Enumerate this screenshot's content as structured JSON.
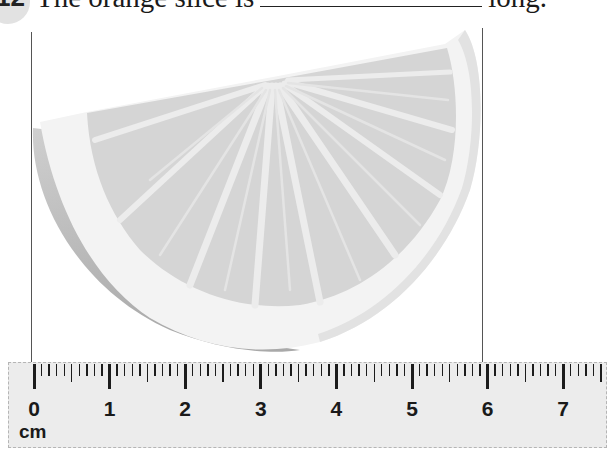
{
  "question": {
    "number": "12",
    "text_before": "The orange slice is",
    "blank_value": "",
    "text_after": "long."
  },
  "figure": {
    "object": "orange slice",
    "icon": "orange-slice-illustration",
    "guide_lines": {
      "left_cm": 0,
      "right_cm": 6
    }
  },
  "ruler": {
    "unit_label": "cm",
    "labels": [
      "0",
      "1",
      "2",
      "3",
      "4",
      "5",
      "6",
      "7"
    ],
    "max_mm": 75,
    "colors": {
      "body": "#ececec",
      "ticks": "#1c1c1c"
    }
  }
}
